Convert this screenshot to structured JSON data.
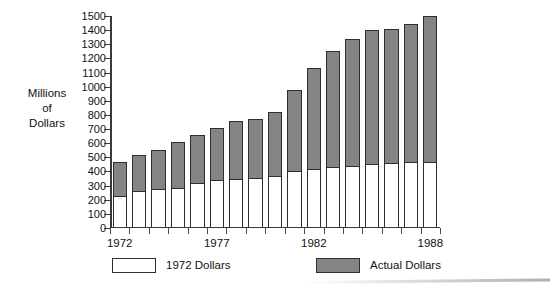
{
  "y_axis_title": {
    "line1": "Millions",
    "line2": "of",
    "line3": "Dollars"
  },
  "legend": {
    "entries": [
      {
        "label": "1972 Dollars",
        "swatch": "white",
        "color": "#ffffff"
      },
      {
        "label": "Actual Dollars",
        "swatch": "gray",
        "color": "#848484"
      }
    ]
  },
  "colors": {
    "actual_dollars": "#848484",
    "constant_dollars": "#ffffff",
    "outline": "#2e2e2e",
    "axis": "#3a3a3a"
  },
  "chart_data": {
    "type": "bar",
    "title": "",
    "xlabel": "",
    "ylabel": "Millions of Dollars",
    "stacked": true,
    "grid": false,
    "legend_position": "bottom",
    "ylim": [
      0,
      1500
    ],
    "ytick_labels": [
      "0",
      "100",
      "200",
      "300",
      "400",
      "500",
      "600",
      "700",
      "800",
      "900",
      "1000",
      "1100",
      "1200",
      "1300",
      "1400",
      "1500"
    ],
    "ytick_values": [
      0,
      100,
      200,
      300,
      400,
      500,
      600,
      700,
      800,
      900,
      1000,
      1100,
      1200,
      1300,
      1400,
      1500
    ],
    "categories": [
      "1972",
      "1973",
      "1974",
      "1975",
      "1976",
      "1977",
      "1978",
      "1979",
      "1980",
      "1981",
      "1982",
      "1983",
      "1984",
      "1985",
      "1986",
      "1987",
      "1988"
    ],
    "xtick_labels_shown": [
      "1972",
      "1977",
      "1982",
      "1988"
    ],
    "series": [
      {
        "name": "1972 Dollars",
        "color": "#ffffff",
        "values": [
          230,
          265,
          275,
          280,
          320,
          340,
          345,
          355,
          370,
          400,
          420,
          430,
          440,
          450,
          460,
          465,
          470
        ]
      },
      {
        "name": "Actual Dollars",
        "color": "#848484",
        "values": [
          470,
          515,
          550,
          610,
          655,
          710,
          755,
          770,
          820,
          980,
          1130,
          1255,
          1340,
          1400,
          1405,
          1440,
          1500
        ],
        "note": "values are bar totals (top of stacked bar)"
      }
    ]
  }
}
